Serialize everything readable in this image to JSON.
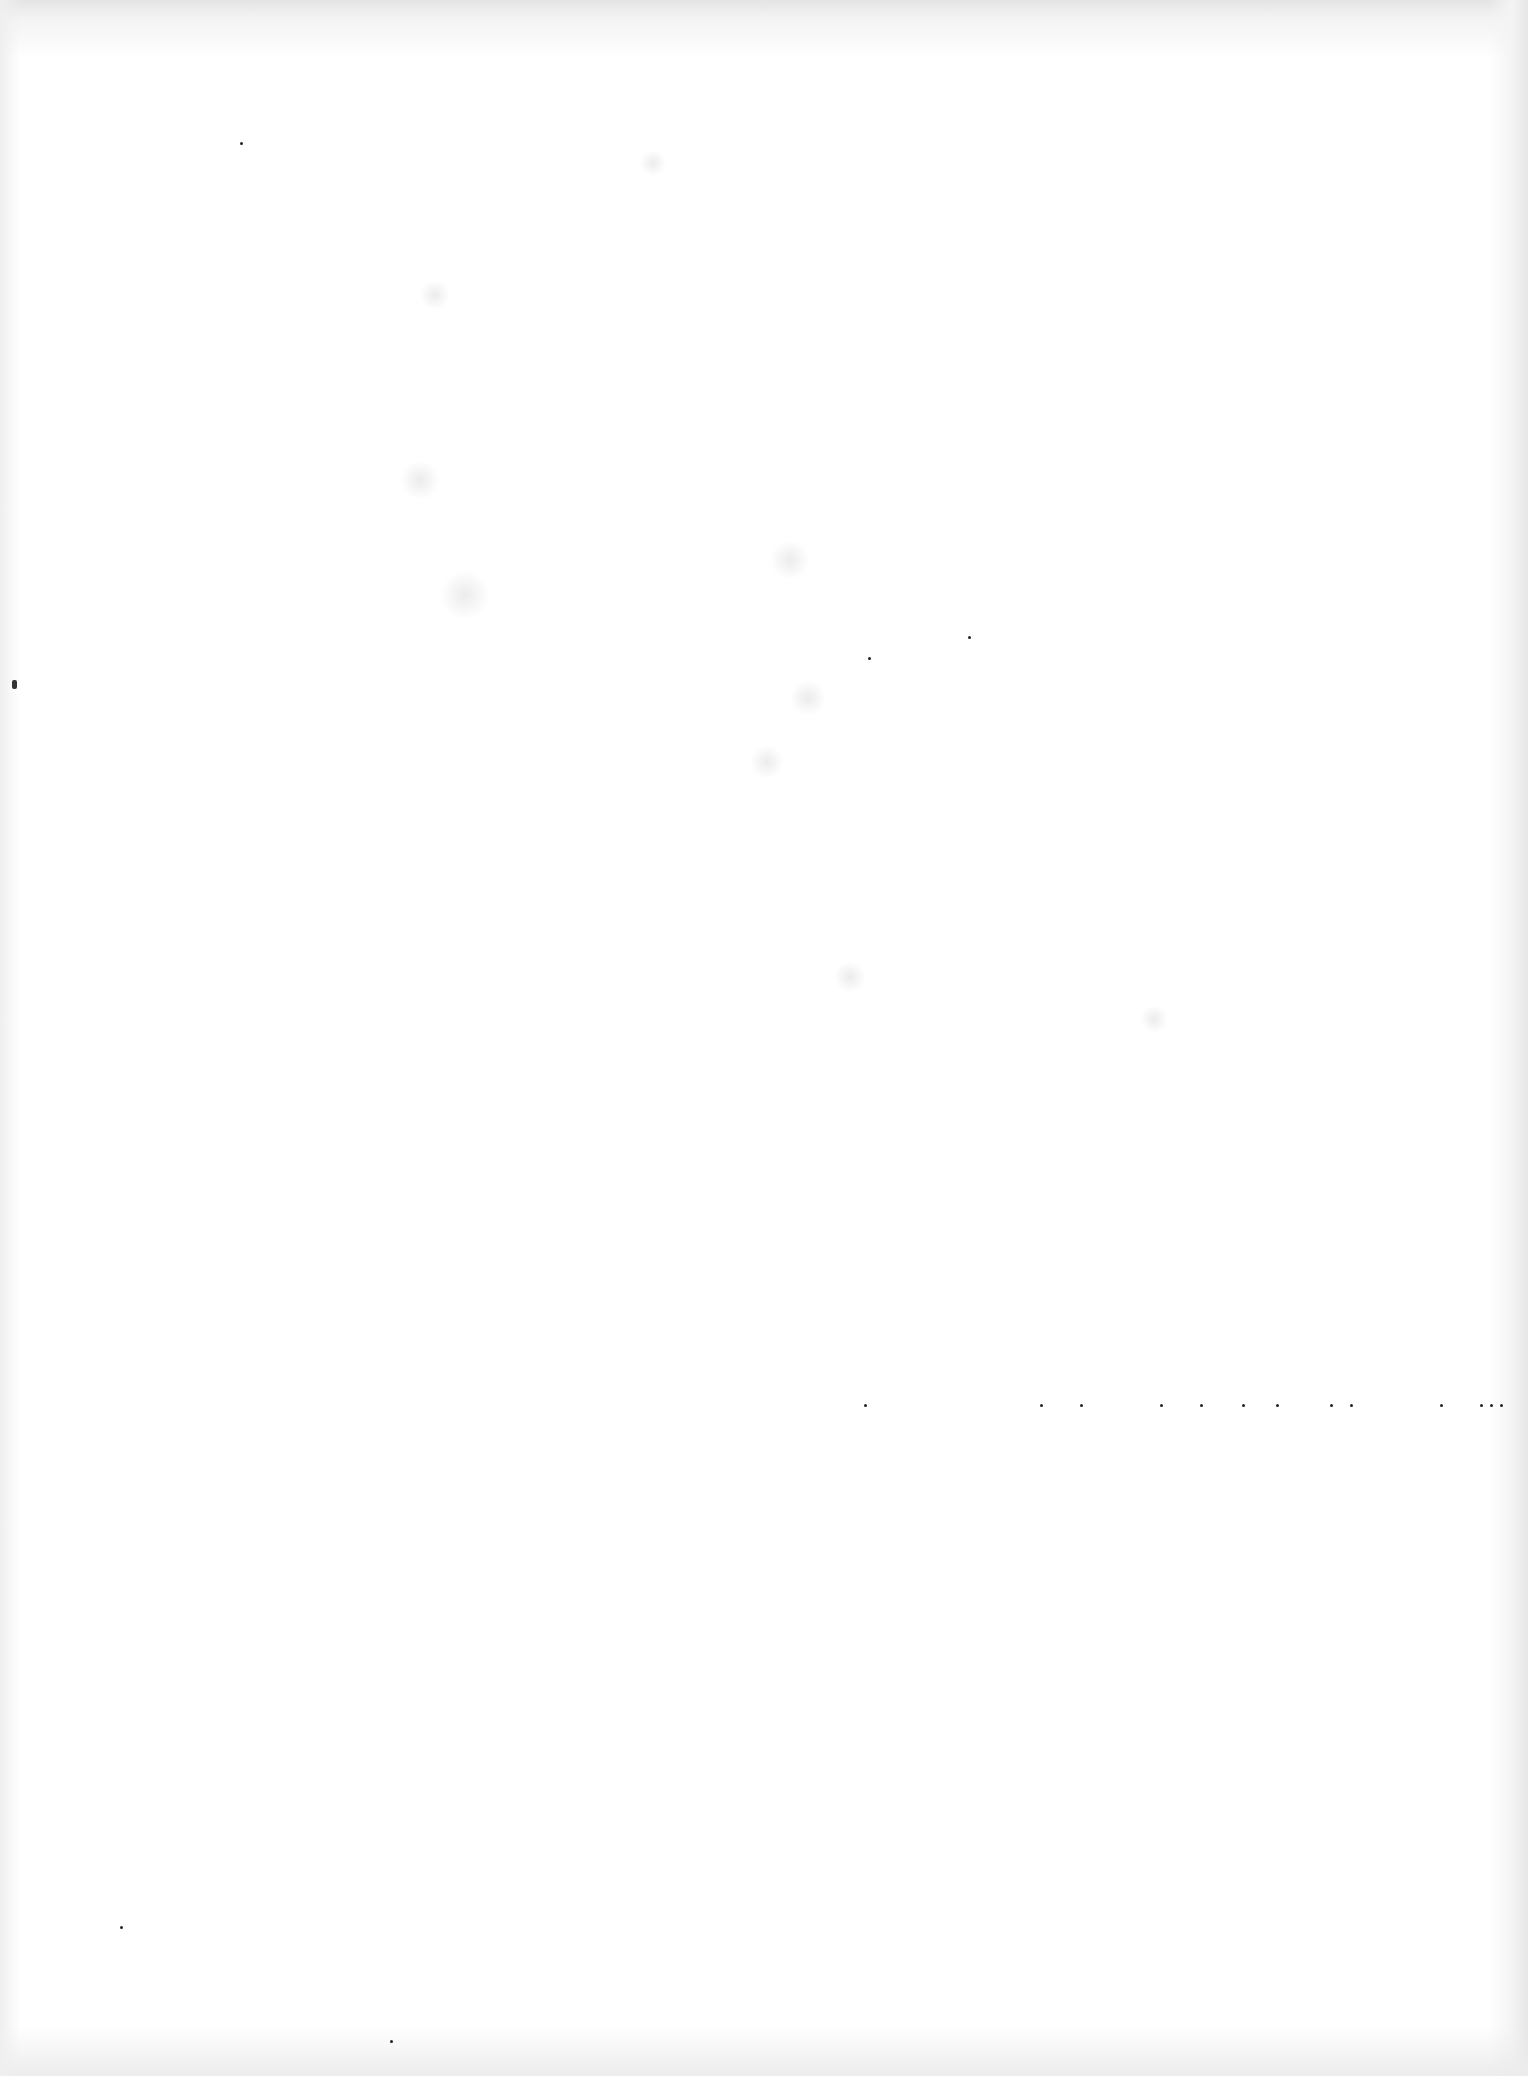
{
  "page": {
    "type": "blank-scanned-page",
    "background_color": "#ffffff",
    "text_content": ""
  }
}
